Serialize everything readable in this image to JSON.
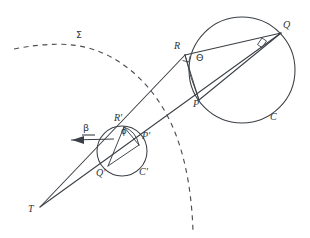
{
  "figure": {
    "kind": "geometric-diagram",
    "background_color": "#ffffff",
    "ink_color": "#3a3f45",
    "width": 310,
    "height": 238
  },
  "labels": {
    "sigma": {
      "text": "Σ",
      "x": 76,
      "y": 35
    },
    "Q": {
      "text": "Q",
      "x": 283,
      "y": 25
    },
    "R": {
      "text": "R",
      "x": 175,
      "y": 46
    },
    "theta": {
      "text": "Θ",
      "x": 196,
      "y": 58
    },
    "P": {
      "text": "P",
      "x": 194,
      "y": 103
    },
    "C": {
      "text": "C",
      "x": 271,
      "y": 116
    },
    "R_prime": {
      "text": "R'",
      "x": 115,
      "y": 118
    },
    "phi": {
      "text": "ϕ",
      "x": 122,
      "y": 131
    },
    "P_prime": {
      "text": "P'",
      "x": 143,
      "y": 136
    },
    "beta": {
      "text": "β",
      "x": 84,
      "y": 128
    },
    "Q_prime": {
      "text": "Q'",
      "x": 97,
      "y": 173
    },
    "C_prime": {
      "text": "C'",
      "x": 140,
      "y": 172
    },
    "T": {
      "text": "T",
      "x": 29,
      "y": 209
    }
  },
  "points": {
    "T": {
      "x": 40,
      "y": 207
    },
    "P": {
      "x": 199,
      "y": 100
    },
    "Q": {
      "x": 281,
      "y": 33
    },
    "R": {
      "x": 185,
      "y": 55
    },
    "P_prime": {
      "x": 139,
      "y": 145
    },
    "Q_prime": {
      "x": 108,
      "y": 166
    },
    "R_prime": {
      "x": 124,
      "y": 127
    }
  },
  "circles": {
    "C": {
      "cx": 242,
      "cy": 70,
      "r": 53,
      "label": "C"
    },
    "C_prime": {
      "cx": 122,
      "cy": 151,
      "r": 25,
      "label": "C'"
    }
  },
  "angles": {
    "theta": {
      "at": "R",
      "label": "Θ",
      "marked": true
    },
    "phi": {
      "at": "R'",
      "label": "ϕ",
      "marked": true
    },
    "beta": {
      "label": "β",
      "annotated_with_arrow": true
    }
  },
  "curve": {
    "name": "sigma-dashed-curve",
    "label": "Σ",
    "style": "dashed"
  }
}
